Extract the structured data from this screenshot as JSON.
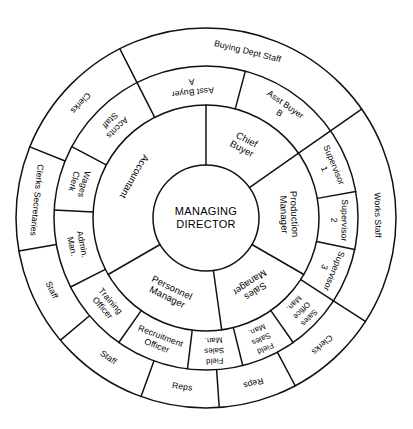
{
  "chart_data": {
    "type": "diagram",
    "geometry": {
      "center_x": 206,
      "center_y": 218,
      "radii": [
        53,
        113,
        152,
        190
      ]
    },
    "center": {
      "line1": "MANAGING",
      "line2": "DIRECTOR"
    },
    "ring2": [
      {
        "id": "chief-buyer",
        "line1": "Chief",
        "line2": "Buyer",
        "start": 270,
        "end": 325
      },
      {
        "id": "production-manager",
        "line1": "Production",
        "line2": "Manager",
        "start": 325,
        "end": 30
      },
      {
        "id": "sales-manager",
        "line1": "Sales",
        "line2": "Manager",
        "start": 30,
        "end": 82
      },
      {
        "id": "personnel-manager",
        "line1": "Personnel",
        "line2": "Manager",
        "start": 82,
        "end": 150
      },
      {
        "id": "accountant",
        "line1": "Accountant",
        "line2": "",
        "start": 150,
        "end": 270
      }
    ],
    "ring3": [
      {
        "id": "asst-buyer-a",
        "line1": "Asst Buyer",
        "line2": "A",
        "start": 243,
        "end": 285
      },
      {
        "id": "asst-buyer-b",
        "line1": "Asst Buyer",
        "line2": "B",
        "start": 285,
        "end": 325
      },
      {
        "id": "supervisor-1",
        "line1": "Supervisor",
        "line2": "1",
        "start": 325,
        "end": 350
      },
      {
        "id": "supervisor-2",
        "line1": "Supervisor",
        "line2": "2",
        "start": 350,
        "end": 12
      },
      {
        "id": "supervisor-3",
        "line1": "Supervisor",
        "line2": "3",
        "start": 12,
        "end": 33
      },
      {
        "id": "sales-office-man",
        "line1": "Sales",
        "line2": "Office",
        "line3": "Man.",
        "start": 33,
        "end": 55
      },
      {
        "id": "field-sales-man-1",
        "line1": "Field",
        "line2": "Sales",
        "line3": "Man.",
        "start": 55,
        "end": 76
      },
      {
        "id": "field-sales-man-2",
        "line1": "Field",
        "line2": "Sales",
        "line3": "Man.",
        "start": 76,
        "end": 97
      },
      {
        "id": "recruitment-officer",
        "line1": "Recruitment",
        "line2": "Officer",
        "start": 97,
        "end": 125
      },
      {
        "id": "training-officer",
        "line1": "Training",
        "line2": "Officer",
        "start": 125,
        "end": 153
      },
      {
        "id": "admin-man",
        "line1": "Admin.",
        "line2": "Man.",
        "start": 153,
        "end": 183
      },
      {
        "id": "wages-clerk",
        "line1": "Wages",
        "line2": "Clerk",
        "start": 183,
        "end": 208
      },
      {
        "id": "accnts-staff",
        "line1": "Accnts",
        "line2": "Staff",
        "start": 208,
        "end": 243
      }
    ],
    "ring4": [
      {
        "id": "buying-dept-staff",
        "label": "Buying Dept  Staff",
        "start": 243,
        "end": 325
      },
      {
        "id": "works-staff",
        "label": "Works Staff",
        "start": 325,
        "end": 33
      },
      {
        "id": "clerks-sales",
        "label": "Clerks",
        "start": 33,
        "end": 62
      },
      {
        "id": "reps-1",
        "label": "Reps",
        "start": 62,
        "end": 86
      },
      {
        "id": "reps-2",
        "label": "Reps",
        "start": 86,
        "end": 110
      },
      {
        "id": "staff-recruitment",
        "label": "Staff",
        "start": 110,
        "end": 140
      },
      {
        "id": "staff-training",
        "label": "Staff",
        "start": 140,
        "end": 170
      },
      {
        "id": "clerks-secretaries",
        "label": "Clerks  Secretaries",
        "start": 170,
        "end": 202
      },
      {
        "id": "clerks-accounts",
        "label": "Clerks",
        "start": 202,
        "end": 243
      }
    ],
    "colors": {
      "stroke": "#111111",
      "background": "#ffffff",
      "text": "#000000"
    }
  }
}
